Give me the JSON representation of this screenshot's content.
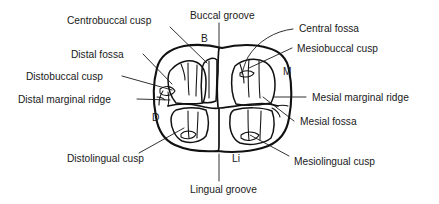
{
  "figure": {
    "background_color": "#ffffff",
    "line_color": "#111111",
    "text_color": "#1a1a1a"
  },
  "labels": {
    "centrobuccal_cusp": "Centrobuccal cusp",
    "buccal_groove": "Buccal groove",
    "central_fossa": "Central fossa",
    "distal_fossa": "Distal fossa",
    "mesiobuccal_cusp": "Mesiobuccal cusp",
    "distobuccal_cusp": "Distobuccal cusp",
    "distal_marginal_ridge": "Distal marginal ridge",
    "mesial_marginal_ridge": "Mesial marginal ridge",
    "mesial_fossa": "Mesial fossa",
    "distolingual_cusp": "Distolingual cusp",
    "mesiolingual_cusp": "Mesiolingual cusp",
    "lingual_groove": "Lingual groove"
  },
  "orientation_markers": {
    "buccal": "B",
    "mesial": "M",
    "distal": "D",
    "lingual": "Li"
  }
}
